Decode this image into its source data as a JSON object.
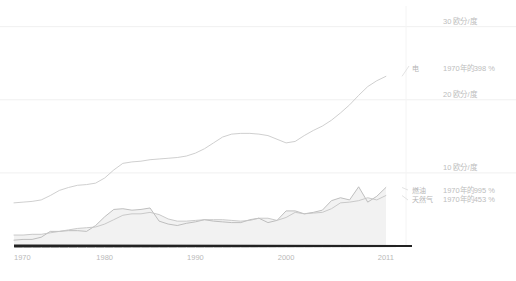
{
  "chart_data": {
    "type": "line",
    "title": "",
    "subtitle": "",
    "xlabel": "",
    "ylabel": "",
    "xlim": [
      1970,
      2013
    ],
    "ylim": [
      0,
      32
    ],
    "grid": true,
    "legend_position": "right-inline",
    "x_tick_labels": [
      "1970",
      "1980",
      "1990",
      "2000",
      "2011"
    ],
    "x_ticks": [
      1970,
      1980,
      1990,
      2000,
      2011
    ],
    "y_tick_labels": [
      "10 欧分/度",
      "20 欧分/度",
      "30 欧分/度"
    ],
    "y_ticks": [
      10,
      20,
      30
    ],
    "y_unit": "欧分/度",
    "x": [
      1970,
      1971,
      1972,
      1973,
      1974,
      1975,
      1976,
      1977,
      1978,
      1979,
      1980,
      1981,
      1982,
      1983,
      1984,
      1985,
      1986,
      1987,
      1988,
      1989,
      1990,
      1991,
      1992,
      1993,
      1994,
      1995,
      1996,
      1997,
      1998,
      1999,
      2000,
      2001,
      2002,
      2003,
      2004,
      2005,
      2006,
      2007,
      2008,
      2009,
      2010,
      2011
    ],
    "series": [
      {
        "name": "电",
        "label": "电",
        "note": "1970年的398 %",
        "value_2011": 23.2,
        "pct_of_1970": 398,
        "color": "#c9c9c9",
        "filled": false,
        "values": [
          5.9,
          6.0,
          6.1,
          6.3,
          6.9,
          7.6,
          8.0,
          8.3,
          8.4,
          8.6,
          9.3,
          10.4,
          11.3,
          11.5,
          11.6,
          11.8,
          11.9,
          12.0,
          12.1,
          12.3,
          12.7,
          13.3,
          14.1,
          14.9,
          15.3,
          15.4,
          15.4,
          15.3,
          15.1,
          14.6,
          14.1,
          14.3,
          15.1,
          15.8,
          16.4,
          17.2,
          18.2,
          19.3,
          20.6,
          21.8,
          22.6,
          23.2
        ]
      },
      {
        "name": "燃油",
        "label": "燃油",
        "note": "1970年的995 %",
        "value_2011": 8.0,
        "pct_of_1970": 995,
        "color": "#b8b8b8",
        "filled": true,
        "values": [
          0.8,
          0.9,
          0.9,
          1.2,
          2.0,
          2.0,
          2.1,
          2.1,
          2.0,
          2.8,
          4.0,
          5.0,
          5.1,
          4.9,
          5.0,
          5.2,
          3.4,
          3.0,
          2.8,
          3.1,
          3.3,
          3.6,
          3.4,
          3.3,
          3.2,
          3.2,
          3.6,
          3.8,
          3.2,
          3.5,
          4.8,
          4.8,
          4.4,
          4.6,
          4.9,
          6.2,
          6.6,
          6.3,
          8.1,
          6.0,
          6.8,
          8.0
        ]
      },
      {
        "name": "天然气",
        "label": "天然气",
        "note": "1970年的453 %",
        "value_2011": 6.9,
        "pct_of_1970": 453,
        "color": "#c4c4c4",
        "filled": true,
        "values": [
          1.5,
          1.5,
          1.6,
          1.6,
          1.8,
          2.0,
          2.2,
          2.4,
          2.5,
          2.6,
          3.0,
          3.6,
          4.2,
          4.4,
          4.4,
          4.6,
          4.3,
          3.7,
          3.4,
          3.4,
          3.5,
          3.6,
          3.6,
          3.6,
          3.5,
          3.4,
          3.5,
          3.8,
          3.8,
          3.5,
          3.9,
          4.6,
          4.4,
          4.5,
          4.6,
          5.1,
          5.9,
          6.0,
          6.2,
          6.6,
          6.3,
          6.9
        ]
      }
    ]
  },
  "axis": {
    "baseline_color": "#222222",
    "gridline_color": "#f0f0f0"
  }
}
